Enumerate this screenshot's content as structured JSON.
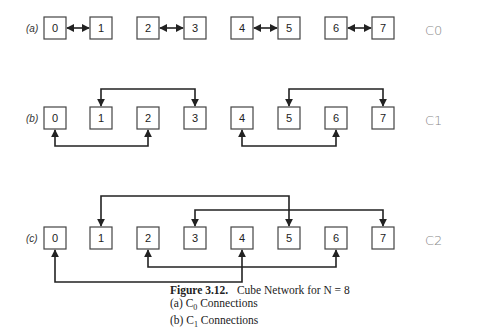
{
  "figure": {
    "title_label": "Figure 3.12.",
    "title_text": "Cube Network for N = 8",
    "items": [
      {
        "label": "(a) C0 Connections"
      },
      {
        "label": "(b) C1 Connections"
      }
    ]
  },
  "rows": [
    {
      "id": "a",
      "label": "(a)",
      "handwritten": "C0"
    },
    {
      "id": "b",
      "label": "(b)",
      "handwritten": "C1"
    },
    {
      "id": "c",
      "label": "(c)",
      "handwritten": "C2"
    }
  ],
  "nodes": [
    "0",
    "1",
    "2",
    "3",
    "4",
    "5",
    "6",
    "7"
  ],
  "connections": {
    "C0": [
      [
        0,
        1
      ],
      [
        2,
        3
      ],
      [
        4,
        5
      ],
      [
        6,
        7
      ]
    ],
    "C1": [
      [
        0,
        2
      ],
      [
        1,
        3
      ],
      [
        4,
        6
      ],
      [
        5,
        7
      ]
    ],
    "C2": [
      [
        0,
        4
      ],
      [
        1,
        5
      ],
      [
        2,
        6
      ],
      [
        3,
        7
      ]
    ]
  },
  "colors": {
    "line": "#222222",
    "box": "#444444",
    "handwriting": "#888888"
  }
}
